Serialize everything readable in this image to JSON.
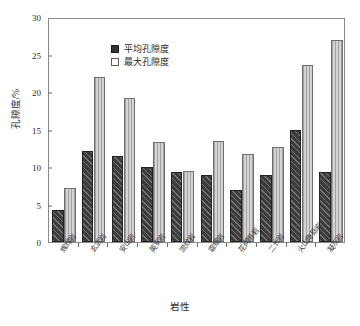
{
  "chart_data": {
    "type": "bar",
    "title": "",
    "xlabel": "岩性",
    "ylabel": "孔隙度/%",
    "ylim": [
      0,
      30
    ],
    "yticks": [
      0,
      5,
      10,
      15,
      20,
      25,
      30
    ],
    "grid": false,
    "legend_position": "top-left",
    "categories": [
      "辉绿岩",
      "玄武岩",
      "安山岩",
      "英安岩",
      "流纹岩",
      "霏细岩",
      "花岗斑岩",
      "二长岩",
      "火山角砾岩",
      "凝灰岩"
    ],
    "series": [
      {
        "name": "平均孔隙度",
        "color": "#3b3b3b",
        "values": [
          4.3,
          12.1,
          11.5,
          10.0,
          9.3,
          8.9,
          7.0,
          9.0,
          14.9,
          9.4
        ]
      },
      {
        "name": "最大孔隙度",
        "color": "#d4d4d4",
        "values": [
          7.2,
          22.0,
          19.2,
          13.4,
          9.5,
          13.5,
          11.7,
          12.7,
          23.6,
          27.0
        ]
      }
    ]
  }
}
